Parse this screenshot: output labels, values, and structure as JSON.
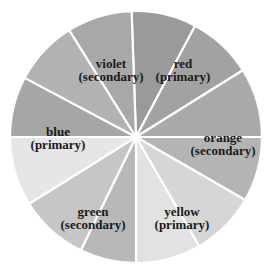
{
  "diagram": {
    "center": [
      136,
      137
    ],
    "radius": 126,
    "gap_color": "#ffffff",
    "segments": [
      {
        "start": -2,
        "end": 28,
        "fill": "#9a9a9a",
        "group": "red"
      },
      {
        "start": 28,
        "end": 58,
        "fill": "#a2a2a2",
        "group": "red"
      },
      {
        "start": 58,
        "end": 90,
        "fill": "#a9a9a9",
        "group": "orange"
      },
      {
        "start": 90,
        "end": 120,
        "fill": "#b4b4b4",
        "group": "orange"
      },
      {
        "start": 120,
        "end": 150,
        "fill": "#d6d6d6",
        "group": "yellow"
      },
      {
        "start": 150,
        "end": 180,
        "fill": "#e2e2e2",
        "group": "yellow"
      },
      {
        "start": 180,
        "end": 206,
        "fill": "#b8b8b8",
        "group": "green"
      },
      {
        "start": 206,
        "end": 238,
        "fill": "#c6c6c6",
        "group": "green"
      },
      {
        "start": 238,
        "end": 270,
        "fill": "#e6e6e6",
        "group": "blue"
      },
      {
        "start": 270,
        "end": 298,
        "fill": "#a6a6a6",
        "group": "blue"
      },
      {
        "start": 298,
        "end": 328,
        "fill": "#b2b2b2",
        "group": "violet"
      },
      {
        "start": 328,
        "end": 358,
        "fill": "#a8a8a8",
        "group": "violet"
      }
    ],
    "labels": [
      {
        "id": "violet",
        "name": "violet",
        "type": "(secondary)",
        "x": 111,
        "y": 70
      },
      {
        "id": "red",
        "name": "red",
        "type": "(primary)",
        "x": 183,
        "y": 70
      },
      {
        "id": "blue",
        "name": "blue",
        "type": "(primary)",
        "x": 58,
        "y": 138
      },
      {
        "id": "orange",
        "name": "orange",
        "type": "(secondary)",
        "x": 223,
        "y": 144
      },
      {
        "id": "green",
        "name": "green",
        "type": "(secondary)",
        "x": 93,
        "y": 218
      },
      {
        "id": "yellow",
        "name": "yellow",
        "type": "(primary)",
        "x": 182,
        "y": 218
      }
    ]
  }
}
